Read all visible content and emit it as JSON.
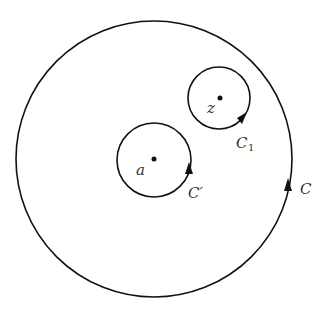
{
  "diagram": {
    "stroke_color": "#111111",
    "contours": [
      {
        "id": "outer",
        "label": "C",
        "label_sub": "",
        "orientation": "counterclockwise"
      },
      {
        "id": "around-a",
        "label": "C′",
        "label_sub": "",
        "center_point": "a",
        "orientation": "counterclockwise"
      },
      {
        "id": "around-z",
        "label": "C",
        "label_sub": "1",
        "center_point": "z",
        "orientation": "counterclockwise"
      }
    ],
    "points": [
      {
        "id": "a",
        "label": "a"
      },
      {
        "id": "z",
        "label": "z"
      }
    ]
  }
}
